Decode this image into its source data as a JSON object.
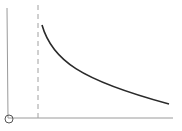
{
  "diagram": {
    "type": "asymptote-curve",
    "colors": {
      "axis": "#9a9a9a",
      "curve": "#2a2a2a",
      "asymptote": "#a0a0a0",
      "origin_marker": "#555555",
      "background": "#ffffff"
    },
    "axes": {
      "origin": [
        9,
        118
      ],
      "y_axis_top": [
        7,
        8
      ],
      "x_axis_right": [
        173,
        118
      ]
    },
    "asymptote": {
      "x": 38,
      "y_top": 5,
      "y_bottom": 118,
      "style": "dashed"
    },
    "curve": {
      "start": [
        42,
        25
      ],
      "end": [
        169,
        104
      ]
    },
    "origin_marker": {
      "cx": 9,
      "cy": 119,
      "r": 4
    }
  }
}
